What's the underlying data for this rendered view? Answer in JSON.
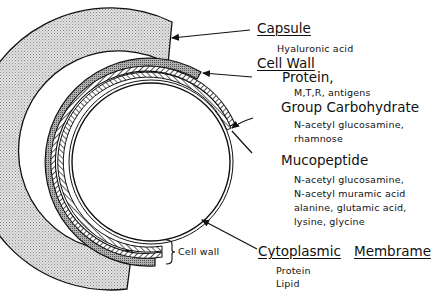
{
  "labels": {
    "capsule": {
      "title": "Capsule",
      "detail": "Hyaluronic acid"
    },
    "cell_wall_heading": "Cell Wall",
    "protein": {
      "title": "Protein,",
      "detail": "M,T,R, antigens"
    },
    "group_carbohydrate": {
      "title": "Group Carbohydrate",
      "detail_lines": [
        "N-acetyl glucosamine,",
        "rhamnose"
      ]
    },
    "mucopeptide": {
      "title": "Mucopeptide",
      "detail_lines": [
        "N-acetyl glucosamine,",
        "N-acetyl muramic acid",
        "alanine, glutamic acid,",
        "lysine, glycine"
      ]
    },
    "cytoplasmic_membrane": {
      "title_part1": "Cytoplasmic",
      "title_part2": "Membrame",
      "detail_lines": [
        "Protein",
        "Lipid"
      ]
    },
    "cell_wall_bracket": "Cell wall"
  },
  "colors": {
    "line": "#111111",
    "capsule_fill": "#d9d9d9",
    "protein_fill": "#9a9a9a",
    "background": "#ffffff"
  }
}
